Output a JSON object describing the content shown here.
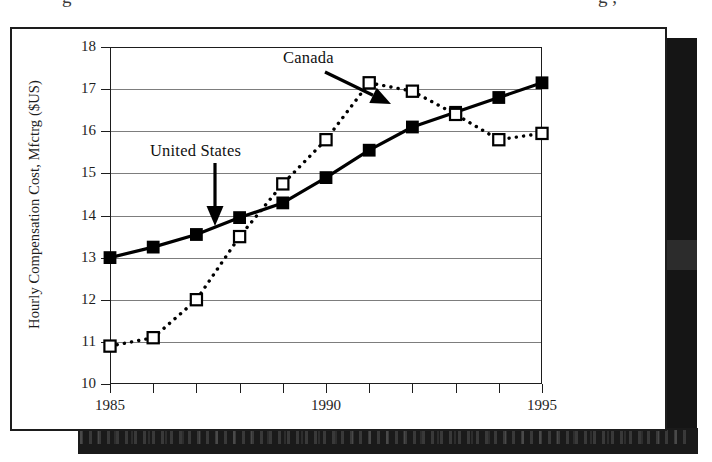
{
  "page": {
    "background": "#ffffff",
    "scan_artifact_top": "g",
    "scan_artifact_top_right": "g ,"
  },
  "figure": {
    "frame_color": "#1d1d1d",
    "shadow_color": "#151515"
  },
  "annotations": [
    {
      "id": "canada",
      "label": "Canada"
    },
    {
      "id": "united-states",
      "label": "United States"
    }
  ],
  "chart_data": {
    "type": "line",
    "title": "",
    "subtitle": "",
    "xlabel": "",
    "ylabel": "Hourly Compensation Cost, Mfctrg ($US)",
    "x": [
      1985,
      1986,
      1987,
      1988,
      1989,
      1990,
      1991,
      1992,
      1993,
      1994,
      1995
    ],
    "xlim": [
      1985,
      1995
    ],
    "ylim": [
      10,
      18
    ],
    "xticks": [
      1985,
      1986,
      1987,
      1988,
      1989,
      1990,
      1991,
      1992,
      1993,
      1994,
      1995
    ],
    "xticklabels": [
      "1985",
      "",
      "",
      "",
      "",
      "1990",
      "",
      "",
      "",
      "",
      "1995"
    ],
    "yticks": [
      10,
      11,
      12,
      13,
      14,
      15,
      16,
      17,
      18
    ],
    "yticklabels": [
      "10",
      "11",
      "12",
      "13",
      "14",
      "15",
      "16",
      "17",
      "18"
    ],
    "grid": "horizontal",
    "legend": "annotations-with-arrows",
    "series": [
      {
        "name": "United States",
        "marker": "filled-square",
        "linestyle": "solid",
        "color": "#000000",
        "values": [
          13.0,
          13.25,
          13.55,
          13.95,
          14.3,
          14.9,
          15.55,
          16.1,
          16.45,
          16.8,
          17.15
        ]
      },
      {
        "name": "Canada",
        "marker": "open-square",
        "linestyle": "dotted",
        "color": "#000000",
        "values": [
          10.9,
          11.1,
          12.0,
          13.5,
          14.75,
          15.8,
          17.15,
          16.95,
          16.4,
          15.8,
          15.95
        ]
      }
    ]
  }
}
